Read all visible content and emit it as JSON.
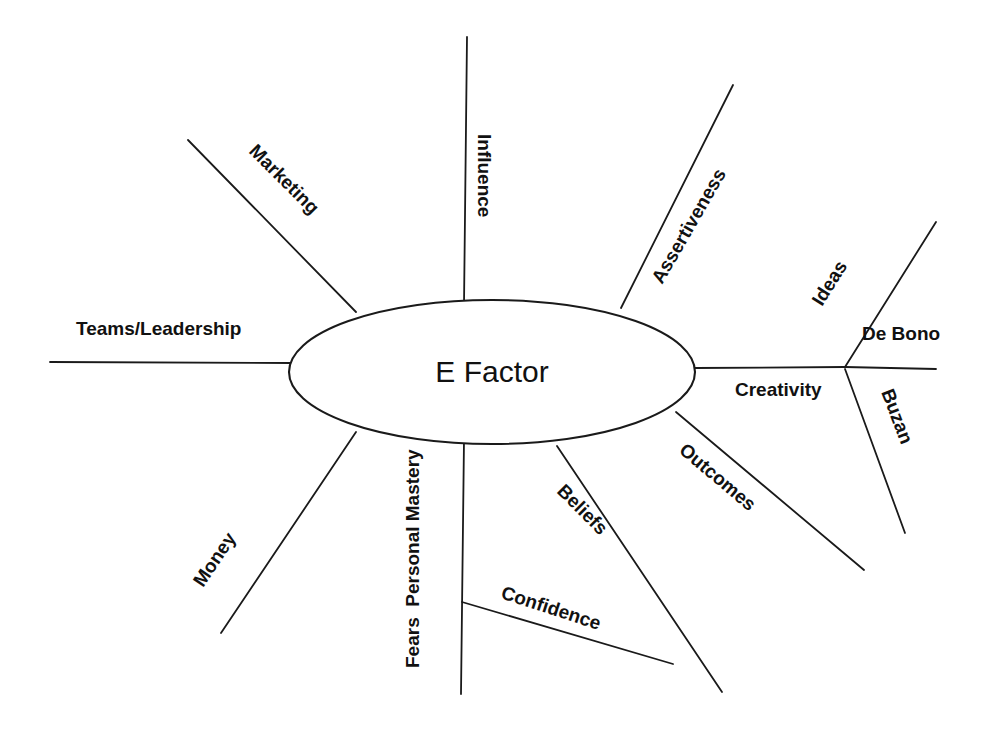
{
  "diagram": {
    "type": "mind-map",
    "title": "E Factor",
    "center": {
      "label": "E Factor",
      "cx": 492,
      "cy": 372,
      "rx": 203,
      "ry": 72
    },
    "branches": [
      {
        "id": "teams-leadership",
        "label": "Teams/Leadership",
        "direction": "left",
        "label_x": 76,
        "label_y": 335,
        "rotation": 0,
        "line": {
          "x1": 50,
          "y1": 362,
          "x2": 292,
          "y2": 363
        }
      },
      {
        "id": "marketing",
        "label": "Marketing",
        "direction": "upper-left",
        "label_x": 248,
        "label_y": 152,
        "rotation": 45,
        "line": {
          "x1": 188,
          "y1": 140,
          "x2": 356,
          "y2": 312
        }
      },
      {
        "id": "influence",
        "label": "Influence",
        "direction": "up",
        "label_x": 478,
        "label_y": 134,
        "rotation": 90,
        "line": {
          "x1": 467,
          "y1": 37,
          "x2": 464,
          "y2": 305
        }
      },
      {
        "id": "assertiveness",
        "label": "Assertiveness",
        "direction": "upper-right",
        "label_x": 662,
        "label_y": 285,
        "rotation": -60,
        "line": {
          "x1": 733,
          "y1": 85,
          "x2": 621,
          "y2": 308
        }
      },
      {
        "id": "creativity",
        "label": "Creativity",
        "direction": "right",
        "label_x": 735,
        "label_y": 396,
        "rotation": 0,
        "line": {
          "x1": 695,
          "y1": 368,
          "x2": 845,
          "y2": 367
        }
      },
      {
        "id": "outcomes",
        "label": "Outcomes",
        "direction": "lower-right",
        "label_x": 678,
        "label_y": 452,
        "rotation": 40,
        "line": {
          "x1": 676,
          "y1": 412,
          "x2": 864,
          "y2": 570
        }
      },
      {
        "id": "beliefs",
        "label": "Beliefs",
        "direction": "lower-right",
        "label_x": 556,
        "label_y": 492,
        "rotation": 45,
        "line": {
          "x1": 557,
          "y1": 446,
          "x2": 722,
          "y2": 692
        }
      },
      {
        "id": "fears-personal-mastery",
        "label": "Fears  Personal Mastery",
        "direction": "down",
        "label_x": 419,
        "label_y": 668,
        "rotation": -90,
        "line": {
          "x1": 464,
          "y1": 440,
          "x2": 461,
          "y2": 694
        }
      },
      {
        "id": "money",
        "label": "Money",
        "direction": "lower-left",
        "label_x": 203,
        "label_y": 588,
        "rotation": -56,
        "line": {
          "x1": 356,
          "y1": 432,
          "x2": 221,
          "y2": 633
        }
      },
      {
        "id": "confidence",
        "label": "Confidence",
        "direction": "lower-right",
        "label_x": 500,
        "label_y": 598,
        "rotation": 18,
        "line": {
          "x1": 462,
          "y1": 602,
          "x2": 673,
          "y2": 664
        }
      }
    ],
    "sub_branches": [
      {
        "id": "ideas",
        "parent": "creativity",
        "label": "Ideas",
        "label_x": 822,
        "label_y": 307,
        "rotation": -58,
        "line": {
          "x1": 845,
          "y1": 367,
          "x2": 936,
          "y2": 222
        }
      },
      {
        "id": "de-bono",
        "parent": "creativity",
        "label": "De Bono",
        "label_x": 862,
        "label_y": 340,
        "rotation": 0,
        "line": {
          "x1": 845,
          "y1": 367,
          "x2": 936,
          "y2": 369
        }
      },
      {
        "id": "buzan",
        "parent": "creativity",
        "label": "Buzan",
        "label_x": 881,
        "label_y": 392,
        "rotation": 69,
        "line": {
          "x1": 845,
          "y1": 369,
          "x2": 905,
          "y2": 533
        }
      }
    ],
    "colors": {
      "background": "#ffffff",
      "stroke": "#1a1a1a",
      "text": "#111111"
    }
  }
}
